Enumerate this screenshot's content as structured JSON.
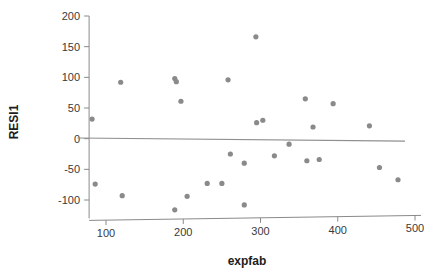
{
  "chart_data": {
    "type": "scatter",
    "title": "",
    "xlabel": "expfab",
    "ylabel": "RESI1",
    "xlim": [
      60,
      500
    ],
    "ylim": [
      -130,
      200
    ],
    "xticks": [
      100,
      200,
      300,
      400,
      500
    ],
    "yticks": [
      200,
      150,
      100,
      50,
      0,
      -50,
      -100
    ],
    "xtick_labels": [
      "100",
      "200",
      "300",
      "400",
      "500"
    ],
    "ytick_labels": [
      "200",
      "150",
      "100",
      "50",
      "0",
      "-50",
      "-100"
    ],
    "grid": false,
    "legend": null,
    "marker_color": "#8a8a8a",
    "line_color": "#8f8f8f",
    "axis_color": "#8a8a8a",
    "series": [
      {
        "name": "residuals",
        "points": [
          [
            82,
            32
          ],
          [
            86,
            -74
          ],
          [
            119,
            92
          ],
          [
            121,
            -93
          ],
          [
            189,
            98
          ],
          [
            191,
            93
          ],
          [
            189,
            -116
          ],
          [
            197,
            61
          ],
          [
            205,
            -94
          ],
          [
            231,
            -73
          ],
          [
            250,
            -73
          ],
          [
            258,
            96
          ],
          [
            261,
            -25
          ],
          [
            279,
            -40
          ],
          [
            279,
            -108
          ],
          [
            294,
            166
          ],
          [
            295,
            26
          ],
          [
            303,
            30
          ],
          [
            318,
            -28
          ],
          [
            337,
            -9
          ],
          [
            358,
            65
          ],
          [
            360,
            -36
          ],
          [
            368,
            19
          ],
          [
            376,
            -34
          ],
          [
            394,
            57
          ],
          [
            441,
            21
          ],
          [
            454,
            -47
          ],
          [
            478,
            -67
          ]
        ]
      }
    ],
    "fit_line": {
      "name": "reference-line",
      "x_start": 63,
      "y_start": 1,
      "x_end": 487,
      "y_end": -4
    }
  }
}
